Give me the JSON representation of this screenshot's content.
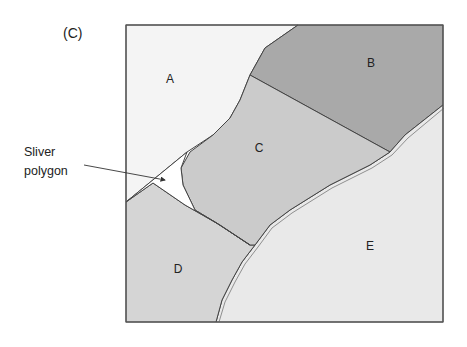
{
  "figure": {
    "panel_label": "(C)",
    "callout": {
      "line1": "Sliver",
      "line2": "polygon"
    },
    "regions": [
      {
        "id": "A",
        "label": "A",
        "fill": "#f4f4f4"
      },
      {
        "id": "B",
        "label": "B",
        "fill": "#a9a9a9"
      },
      {
        "id": "C",
        "label": "C",
        "fill": "#cbcbcb"
      },
      {
        "id": "D",
        "label": "D",
        "fill": "#d5d5d5"
      },
      {
        "id": "E",
        "label": "E",
        "fill": "#e9e9e9"
      }
    ],
    "sliver": {
      "fill": "#ffffff"
    },
    "border_color": "#555555"
  }
}
